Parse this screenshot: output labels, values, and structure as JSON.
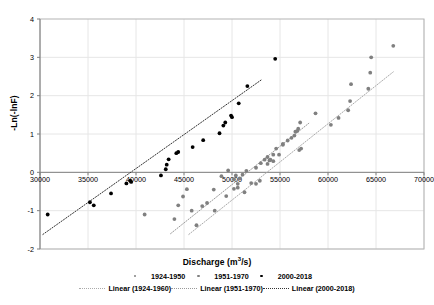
{
  "chart_data": {
    "type": "scatter",
    "title": "",
    "xlabel": "Discharge (m3/s)",
    "ylabel": "-Ln(-lnF)",
    "xlim": [
      30000,
      70000
    ],
    "ylim": [
      -2,
      4
    ],
    "xticks": [
      30000,
      35000,
      40000,
      45000,
      50000,
      55000,
      60000,
      65000,
      70000
    ],
    "yticks": [
      4,
      3,
      2,
      1,
      0,
      -1,
      -2
    ],
    "xtick_labels": [
      "30000",
      "35000",
      "40000",
      "45000",
      "50000",
      "55000",
      "60000",
      "65000",
      "70000"
    ],
    "ytick_labels": [
      "4",
      "3",
      "2",
      "1",
      "0",
      "-1",
      "-2"
    ],
    "grid": true,
    "legend_position": "bottom",
    "series": [
      {
        "name": "1924-1950",
        "color": "#808080",
        "marker": "circle",
        "points": [
          [
            40900,
            -1.1
          ],
          [
            46300,
            -1.38
          ],
          [
            46900,
            -0.88
          ],
          [
            48200,
            -1.0
          ],
          [
            49400,
            -0.62
          ],
          [
            50200,
            -0.43
          ],
          [
            50600,
            -0.3
          ],
          [
            50800,
            -0.16
          ],
          [
            51100,
            -0.06
          ],
          [
            51500,
            0.04
          ],
          [
            52500,
            -0.3
          ],
          [
            52900,
            -0.22
          ],
          [
            53700,
            0.22
          ],
          [
            54000,
            0.33
          ],
          [
            54300,
            0.46
          ],
          [
            54600,
            0.62
          ],
          [
            55300,
            0.74
          ],
          [
            56200,
            0.9
          ],
          [
            56600,
            1.06
          ],
          [
            56900,
            1.14
          ],
          [
            57000,
            0.58
          ],
          [
            58700,
            1.54
          ],
          [
            60300,
            1.24
          ],
          [
            61100,
            1.42
          ],
          [
            62100,
            1.62
          ],
          [
            62300,
            1.86
          ],
          [
            62400,
            2.3
          ],
          [
            64200,
            2.18
          ],
          [
            64400,
            2.6
          ],
          [
            64500,
            3.0
          ],
          [
            66800,
            3.3
          ]
        ]
      },
      {
        "name": "1951-1970",
        "color": "#808080",
        "marker": "circle",
        "points": [
          [
            44000,
            -1.22
          ],
          [
            44400,
            -0.86
          ],
          [
            44900,
            -0.63
          ],
          [
            45300,
            -0.44
          ],
          [
            45800,
            -1.0
          ],
          [
            47400,
            -0.8
          ],
          [
            48100,
            -0.45
          ],
          [
            48900,
            -0.1
          ],
          [
            49600,
            0.05
          ],
          [
            50200,
            -0.18
          ],
          [
            50400,
            -0.08
          ],
          [
            50600,
            -0.4
          ],
          [
            51300,
            -0.52
          ],
          [
            52000,
            -0.28
          ],
          [
            52500,
            0.12
          ],
          [
            53000,
            0.24
          ],
          [
            53400,
            0.33
          ],
          [
            53700,
            0.4
          ],
          [
            53900,
            0.31
          ],
          [
            54300,
            0.29
          ],
          [
            54900,
            0.46
          ],
          [
            55300,
            0.72
          ],
          [
            55800,
            0.83
          ],
          [
            56500,
            0.96
          ],
          [
            56800,
            1.08
          ],
          [
            57100,
            1.3
          ],
          [
            57200,
            0.62
          ]
        ]
      },
      {
        "name": "2000-2018",
        "color": "#000000",
        "marker": "circle",
        "points": [
          [
            30800,
            -1.1
          ],
          [
            35200,
            -0.78
          ],
          [
            35600,
            -0.86
          ],
          [
            37400,
            -0.55
          ],
          [
            39000,
            -0.29
          ],
          [
            39400,
            -0.22
          ],
          [
            39500,
            -0.25
          ],
          [
            42600,
            -0.08
          ],
          [
            43100,
            0.08
          ],
          [
            43200,
            0.2
          ],
          [
            43400,
            0.34
          ],
          [
            44200,
            0.5
          ],
          [
            44400,
            0.53
          ],
          [
            45900,
            0.66
          ],
          [
            47000,
            0.84
          ],
          [
            48700,
            1.02
          ],
          [
            49100,
            1.22
          ],
          [
            49300,
            1.3
          ],
          [
            49900,
            1.48
          ],
          [
            50000,
            1.44
          ],
          [
            50700,
            1.8
          ],
          [
            51600,
            2.25
          ],
          [
            54500,
            2.96
          ]
        ]
      }
    ],
    "trendlines": [
      {
        "name": "Linear (1924-1960)",
        "color": "#aaaaaa",
        "x_start": 45500,
        "y_start": -1.62,
        "x_end": 66800,
        "y_end": 2.62
      },
      {
        "name": "Linear (1951-1970)",
        "color": "#999999",
        "x_start": 43600,
        "y_start": -1.6,
        "x_end": 58000,
        "y_end": 1.28
      },
      {
        "name": "Linear (2000-2018)",
        "color": "#333333",
        "x_start": 30300,
        "y_start": -1.62,
        "x_end": 53100,
        "y_end": 2.42
      }
    ]
  },
  "axis": {
    "x_title_main": "Discharge (m",
    "x_title_sup": "3",
    "x_title_tail": "/s)",
    "y_title": "-Ln(-lnF)"
  },
  "legend": {
    "markers": [
      {
        "label": "1924-1950",
        "color": "#808080"
      },
      {
        "label": "1951-1970",
        "color": "#808080"
      },
      {
        "label": "2000-2018",
        "color": "#000000"
      }
    ],
    "lines": [
      {
        "label": "Linear (1924-1960)",
        "color": "#aaaaaa"
      },
      {
        "label": "Linear (1951-1970)",
        "color": "#999999"
      },
      {
        "label": "Linear (2000-2018)",
        "color": "#333333"
      }
    ]
  },
  "colors": {
    "plot_border": "#b3b3b3",
    "gridline": "#e6e6e6",
    "text": "#000000",
    "series_gray": "#808080",
    "series_black": "#000000"
  }
}
